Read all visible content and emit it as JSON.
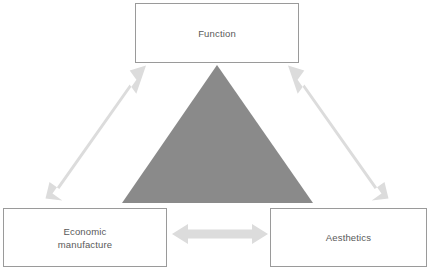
{
  "diagram": {
    "background_color": "#ffffff",
    "nodes": [
      {
        "id": "function",
        "label": "Function",
        "border_color": "#9a9a9a",
        "fill_color": "#ffffff",
        "text_color": "#595959"
      },
      {
        "id": "economic-manufacture",
        "label": "Economic\nmanufacture",
        "border_color": "#9a9a9a",
        "fill_color": "#ffffff",
        "text_color": "#595959"
      },
      {
        "id": "aesthetics",
        "label": "Aesthetics",
        "border_color": "#9a9a9a",
        "fill_color": "#ffffff",
        "text_color": "#595959"
      }
    ],
    "center_shape": {
      "id": "center-triangle",
      "type": "triangle",
      "fill_color": "#8a8a8a",
      "apex": [
        217,
        65
      ],
      "base_left": [
        122,
        203
      ],
      "base_right": [
        313,
        203
      ]
    },
    "connectors": [
      {
        "id": "function-economic",
        "from": "economic-manufacture",
        "to": "function",
        "style": "double-headed-arrow",
        "color": "#dcdcdc",
        "orientation": "diagonal-up-right"
      },
      {
        "id": "function-aesthetics",
        "from": "function",
        "to": "aesthetics",
        "style": "double-headed-arrow",
        "color": "#dcdcdc",
        "orientation": "diagonal-down-right"
      },
      {
        "id": "economic-aesthetics",
        "from": "economic-manufacture",
        "to": "aesthetics",
        "style": "double-headed-arrow",
        "color": "#dcdcdc",
        "orientation": "horizontal"
      }
    ]
  }
}
